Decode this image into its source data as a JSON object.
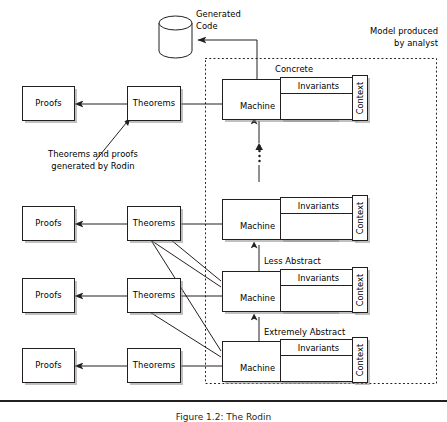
{
  "figure": {
    "boundary_label_line1": "Model produced",
    "boundary_label_line2": "by analyst",
    "generated_code_line1": "Generated",
    "generated_code_line2": "Code",
    "annotation_line1": "Theorems and proofs",
    "annotation_line2": "generated by Rodin",
    "concrete_label": "Concrete",
    "less_abstract_label": "Less Abstract",
    "extremely_abstract_label": "Extremely Abstract",
    "vertical_ellipsis": "⋮",
    "caption": "Figure 1.2: The Rodin",
    "colors": {
      "stroke": "#231f20",
      "fill": "#ffffff",
      "shadow": "#8c8c8c",
      "dotted_border": "#231f20",
      "rule": "#231f20"
    },
    "rows": [
      {
        "id": "concrete",
        "proofs_label": "Proofs",
        "theorems_label": "Theorems",
        "machine_label": "Machine",
        "invariants_label": "Invariants",
        "context_label": "Context",
        "tier_label": "Concrete"
      },
      {
        "id": "middle",
        "proofs_label": "Proofs",
        "theorems_label": "Theorems",
        "machine_label": "Machine",
        "invariants_label": "Invariants",
        "context_label": "Context",
        "tier_label": ""
      },
      {
        "id": "less-abstract",
        "proofs_label": "Proofs",
        "theorems_label": "Theorems",
        "machine_label": "Machine",
        "invariants_label": "Invariants",
        "context_label": "Context",
        "tier_label": "Less Abstract"
      },
      {
        "id": "extremely-abstract",
        "proofs_label": "Proofs",
        "theorems_label": "Theorems",
        "machine_label": "Machine",
        "invariants_label": "Invariants",
        "context_label": "Context",
        "tier_label": "Extremely Abstract"
      }
    ]
  }
}
